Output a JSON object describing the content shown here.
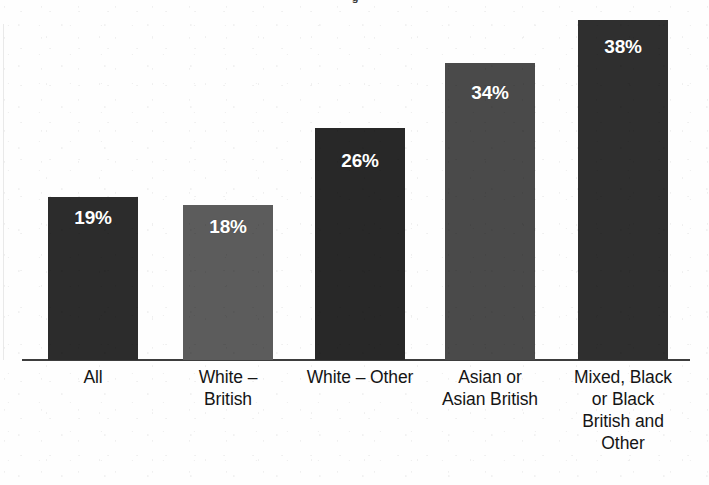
{
  "chart_data": {
    "type": "bar",
    "title": "",
    "xlabel": "",
    "ylabel": "",
    "ylim": [
      0,
      45
    ],
    "grid": false,
    "legend": "none",
    "value_label_suffix": "%",
    "categories": [
      "All",
      "White –\nBritish",
      "White – Other",
      "Asian or\nAsian British",
      "Mixed, Black\nor Black\nBritish and\nOther"
    ],
    "values": [
      19,
      18,
      26,
      34,
      38
    ],
    "value_labels": [
      "19%",
      "18%",
      "26%",
      "34%",
      "38%"
    ],
    "bar_colors": [
      "#2c2c2c",
      "#5c5c5c",
      "#282828",
      "#4a4a4a",
      "#2f2f2f"
    ],
    "value_label_color": "#ffffff",
    "axis_color": "#3d3d3d"
  },
  "axes": {
    "baseline_present": true,
    "left_axis_present": true
  },
  "title_remnant": {
    "text": "g"
  },
  "bars": [
    {
      "name": "bar-all",
      "label": "19%",
      "left": 48,
      "top": 197,
      "width": 90,
      "height": 163,
      "color": "#2c2c2c",
      "label_top": 10
    },
    {
      "name": "bar-white-british",
      "label": "18%",
      "left": 183,
      "top": 205,
      "width": 90,
      "height": 155,
      "color": "#5c5c5c",
      "label_top": 11
    },
    {
      "name": "bar-white-other",
      "label": "26%",
      "left": 315,
      "top": 128,
      "width": 90,
      "height": 232,
      "color": "#282828",
      "label_top": 22
    },
    {
      "name": "bar-asian-or-asian-british",
      "label": "34%",
      "left": 445,
      "top": 63,
      "width": 90,
      "height": 297,
      "color": "#4a4a4a",
      "label_top": 19
    },
    {
      "name": "bar-mixed-black-other",
      "label": "38%",
      "left": 578,
      "top": 20,
      "width": 90,
      "height": 340,
      "color": "#2f2f2f",
      "label_top": 16
    }
  ],
  "category_labels": [
    {
      "name": "category-label-all",
      "text": "All",
      "left": 28,
      "width": 130
    },
    {
      "name": "category-label-white-british",
      "text": "White –\nBritish",
      "left": 163,
      "width": 130
    },
    {
      "name": "category-label-white-other",
      "text": "White – Other",
      "left": 291,
      "width": 138
    },
    {
      "name": "category-label-asian-or-asian-british",
      "text": "Asian or\nAsian British",
      "left": 423,
      "width": 134
    },
    {
      "name": "category-label-mixed-black-other",
      "text": "Mixed, Black\nor Black\nBritish and\nOther",
      "left": 556,
      "width": 134
    }
  ]
}
